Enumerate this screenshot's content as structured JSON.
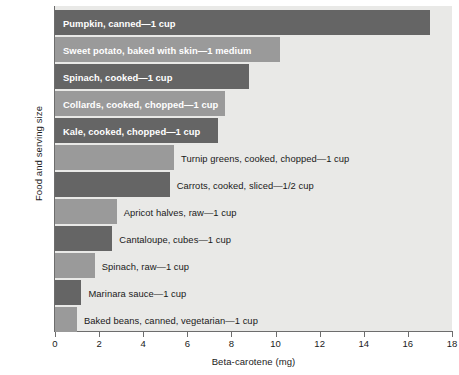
{
  "chart_data": {
    "type": "bar",
    "orientation": "horizontal",
    "title": "",
    "xlabel": "Beta-carotene (mg)",
    "ylabel": "Food and serving size",
    "xlim": [
      0,
      18
    ],
    "xticks": [
      0,
      2,
      4,
      6,
      8,
      10,
      12,
      14,
      16,
      18
    ],
    "xtick_labels": [
      "0",
      "2",
      "4",
      "6",
      "8",
      "10",
      "12",
      "14",
      "16",
      "18"
    ],
    "grid": false,
    "legend": null,
    "categories": [
      "Pumpkin, canned—1 cup",
      "Sweet potato, baked with skin—1 medium",
      "Spinach, cooked—1 cup",
      "Collards, cooked, chopped—1 cup",
      "Kale, cooked, chopped—1 cup",
      "Turnip greens, cooked, chopped—1 cup",
      "Carrots, cooked, sliced—1/2 cup",
      "Apricot halves, raw—1 cup",
      "Cantaloupe, cubes—1 cup",
      "Spinach, raw—1 cup",
      "Marinara sauce—1 cup",
      "Baked beans, canned, vegetarian—1 cup"
    ],
    "values": [
      17.0,
      10.2,
      8.8,
      7.7,
      7.4,
      5.4,
      5.2,
      2.8,
      2.6,
      1.8,
      1.2,
      1.0
    ],
    "bar_colors": [
      "#656565",
      "#9a9a9a",
      "#656565",
      "#9a9a9a",
      "#656565",
      "#9a9a9a",
      "#656565",
      "#9a9a9a",
      "#656565",
      "#9a9a9a",
      "#656565",
      "#9a9a9a"
    ],
    "label_placement": [
      "inside",
      "inside",
      "inside",
      "inside",
      "inside",
      "outside",
      "outside",
      "outside",
      "outside",
      "outside",
      "outside",
      "outside"
    ],
    "plot_background": "#e9e9e7",
    "axis_color": "#6d6d6d"
  }
}
